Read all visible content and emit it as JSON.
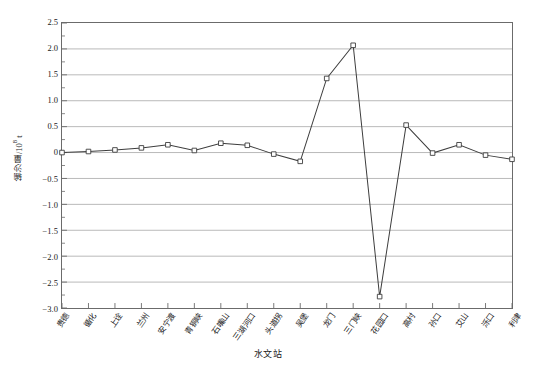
{
  "chart_data": {
    "type": "line",
    "title": "",
    "xlabel": "水文站",
    "ylabel": "输沙量/10",
    "ylabel_exponent": "8",
    "ylabel_unit": "t",
    "ylim": [
      -3.0,
      2.5
    ],
    "ytick_step": 0.5,
    "yminor_step": 0.25,
    "grid": true,
    "grid_axis": "y",
    "legend": "none",
    "marker": "open-square",
    "line_color": "#3d3d3d",
    "grid_color": "#a8a8a8",
    "frame_color": "#6b6b6b",
    "yticks": [
      {
        "value": 2.5,
        "label": "2.5"
      },
      {
        "value": 2.0,
        "label": "2.0"
      },
      {
        "value": 1.5,
        "label": "1.5"
      },
      {
        "value": 1.0,
        "label": "1.0"
      },
      {
        "value": 0.5,
        "label": "0.5"
      },
      {
        "value": 0.0,
        "label": "0"
      },
      {
        "value": -0.5,
        "label": "−0.5"
      },
      {
        "value": -1.0,
        "label": "−1.0"
      },
      {
        "value": -1.5,
        "label": "−1.5"
      },
      {
        "value": -2.0,
        "label": "−2.0"
      },
      {
        "value": -2.5,
        "label": "−2.5"
      },
      {
        "value": -3.0,
        "label": "−3.0"
      }
    ],
    "categories": [
      "贵德",
      "循化",
      "上诠",
      "兰州",
      "安宁渡",
      "青铜峡",
      "石嘴山",
      "三湖河口",
      "头道拐",
      "吴堡",
      "龙门",
      "三门峡",
      "花园口",
      "高村",
      "孙口",
      "艾山",
      "泺口",
      "利津"
    ],
    "values": [
      0.0,
      0.02,
      0.05,
      0.09,
      0.15,
      0.04,
      0.18,
      0.14,
      -0.03,
      -0.17,
      1.43,
      2.07,
      -2.78,
      0.53,
      -0.01,
      0.15,
      -0.05,
      -0.13
    ],
    "series": [
      {
        "name": "输沙量",
        "values": [
          0.0,
          0.02,
          0.05,
          0.09,
          0.15,
          0.04,
          0.18,
          0.14,
          -0.03,
          -0.17,
          1.43,
          2.07,
          -2.78,
          0.53,
          -0.01,
          0.15,
          -0.05,
          -0.13
        ]
      }
    ]
  }
}
